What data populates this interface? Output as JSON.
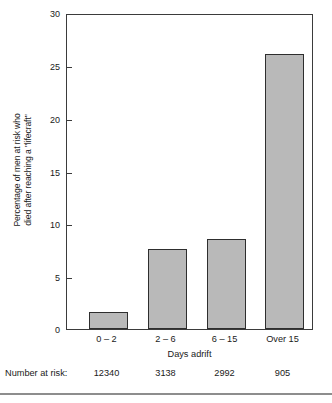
{
  "chart_data": {
    "type": "bar",
    "title": "",
    "subtitle": "",
    "xlabel": "Days adrift",
    "ylabel_line1": "Percentage of men at risk who",
    "ylabel_line2": "died after reaching a \"lifecraft\"",
    "categories": [
      "0 – 2",
      "2 – 6",
      "6 – 15",
      "Over 15"
    ],
    "values": [
      1.6,
      7.6,
      8.5,
      26.1
    ],
    "ylim": [
      0,
      30
    ],
    "yticks": [
      0,
      5,
      10,
      15,
      20,
      25,
      30
    ],
    "ytick_labels": [
      "0",
      "5",
      "10",
      "15",
      "20",
      "25",
      "30"
    ],
    "grid": false,
    "legend": false,
    "bar_fill": "#b9b9b9",
    "bar_edge": "#2e2e2e",
    "axis_color": "#3b3b3b"
  },
  "risk_table": {
    "title": "Number at risk:",
    "values": [
      "12340",
      "3138",
      "2992",
      "905"
    ]
  }
}
